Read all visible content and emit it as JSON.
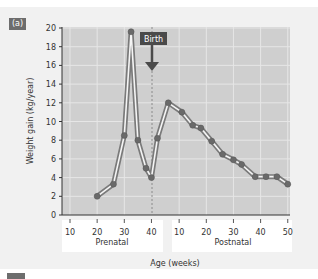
{
  "panel": {
    "label": "(a)"
  },
  "chart_data": {
    "type": "line",
    "title": "",
    "xlabel": "Age (weeks)",
    "ylabel": "Weight gain (kg/year)",
    "ylim": [
      0,
      20
    ],
    "yticks": [
      0,
      2,
      4,
      6,
      8,
      10,
      12,
      14,
      16,
      18,
      20
    ],
    "x_groups": [
      {
        "name": "Prenatal",
        "ticks": [
          10,
          20,
          30,
          40
        ]
      },
      {
        "name": "Postnatal",
        "ticks": [
          10,
          20,
          30,
          40,
          50
        ]
      }
    ],
    "grid": true,
    "annotations": [
      {
        "text": "Birth",
        "at": "40 weeks prenatal",
        "style": "dashed vertical line with arrow"
      }
    ],
    "series": [
      {
        "name": "Weight gain",
        "points": [
          {
            "phase": "Prenatal",
            "week": 20,
            "value": 2.0
          },
          {
            "phase": "Prenatal",
            "week": 26,
            "value": 3.3
          },
          {
            "phase": "Prenatal",
            "week": 30,
            "value": 8.5
          },
          {
            "phase": "Prenatal",
            "week": 32.5,
            "value": 19.6
          },
          {
            "phase": "Prenatal",
            "week": 35,
            "value": 8.0
          },
          {
            "phase": "Prenatal",
            "week": 38,
            "value": 5.0
          },
          {
            "phase": "Prenatal",
            "week": 40,
            "value": 4.0
          },
          {
            "phase": "Postnatal",
            "week": 2,
            "value": 8.2
          },
          {
            "phase": "Postnatal",
            "week": 6,
            "value": 12.0
          },
          {
            "phase": "Postnatal",
            "week": 11,
            "value": 11.0
          },
          {
            "phase": "Postnatal",
            "week": 15,
            "value": 9.6
          },
          {
            "phase": "Postnatal",
            "week": 18,
            "value": 9.3
          },
          {
            "phase": "Postnatal",
            "week": 22,
            "value": 7.9
          },
          {
            "phase": "Postnatal",
            "week": 26,
            "value": 6.5
          },
          {
            "phase": "Postnatal",
            "week": 30,
            "value": 5.9
          },
          {
            "phase": "Postnatal",
            "week": 33,
            "value": 5.4
          },
          {
            "phase": "Postnatal",
            "week": 38,
            "value": 4.1
          },
          {
            "phase": "Postnatal",
            "week": 42,
            "value": 4.1
          },
          {
            "phase": "Postnatal",
            "week": 46,
            "value": 4.1
          },
          {
            "phase": "Postnatal",
            "week": 50,
            "value": 3.3
          }
        ]
      }
    ]
  },
  "labels": {
    "birth": "Birth",
    "prenatal": "Prenatal",
    "postnatal": "Postnatal",
    "xlabel": "Age (weeks)",
    "ylabel": "Weight gain (kg/year)",
    "yticks": [
      "0",
      "2",
      "4",
      "6",
      "8",
      "10",
      "12",
      "14",
      "16",
      "18",
      "20"
    ],
    "xticks_pre": [
      "10",
      "20",
      "30",
      "40"
    ],
    "xticks_post": [
      "10",
      "20",
      "30",
      "40",
      "50"
    ]
  },
  "colors": {
    "plot_bg": "#cfcfcf",
    "grid": "#e6e6e6",
    "line_outer": "#7a7a7a",
    "line_inner": "#f5f5f5",
    "marker": "#6a6a6a",
    "dark": "#4a4a4a"
  }
}
